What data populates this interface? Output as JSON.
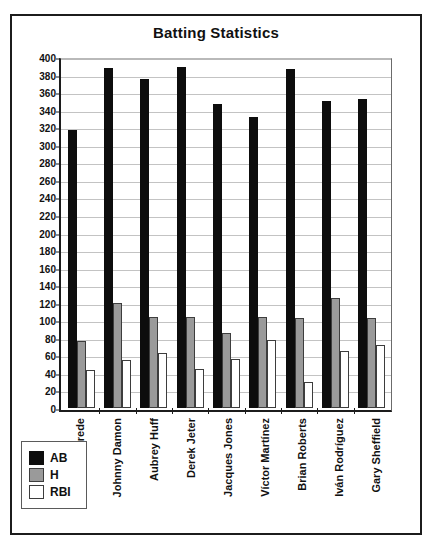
{
  "chart_data": {
    "type": "bar",
    "title": "Batting Statistics",
    "xlabel": "",
    "ylabel": "",
    "ylim": [
      0,
      400
    ],
    "ytick_step": 20,
    "yticks": [
      0,
      20,
      40,
      60,
      80,
      100,
      120,
      140,
      160,
      180,
      200,
      220,
      240,
      260,
      280,
      300,
      320,
      340,
      360,
      380,
      400
    ],
    "grid": true,
    "legend_position": "bottom-left",
    "categories": [
      "Joe Crede",
      "Johnny Damon",
      "Aubrey Huff",
      "Derek Jeter",
      "Jacques Jones",
      "Víctor Martínez",
      "Brian Roberts",
      "Iván Rodríguez",
      "Gary Sheffield"
    ],
    "series": [
      {
        "name": "AB",
        "color": "#0d0d0d",
        "values": [
          319,
          390,
          377,
          391,
          349,
          334,
          388,
          352,
          354
        ]
      },
      {
        "name": "H",
        "color": "#9a9a9a",
        "values": [
          77,
          120,
          104,
          104,
          86,
          104,
          103,
          126,
          103
        ]
      },
      {
        "name": "RBI",
        "color": "#ffffff",
        "values": [
          43,
          55,
          63,
          45,
          56,
          78,
          30,
          65,
          72
        ]
      }
    ]
  },
  "legend": {
    "items": [
      {
        "label": "AB"
      },
      {
        "label": "H"
      },
      {
        "label": "RBI"
      }
    ]
  }
}
